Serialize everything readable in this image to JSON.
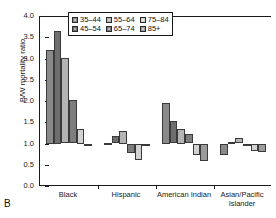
{
  "panel": {
    "letter": "B"
  },
  "chart_data": {
    "type": "bar",
    "title": "",
    "subtitle": "",
    "xlabel": "",
    "ylabel": "B/W mortality ratio",
    "ylim": [
      0.0,
      4.0
    ],
    "ytick_labels": [
      "0.0",
      "0.5",
      "1.0",
      "1.5",
      "2.0",
      "2.5",
      "3.0",
      "3.5",
      "4.0"
    ],
    "ytick_values": [
      0.0,
      0.5,
      1.0,
      1.5,
      2.0,
      2.5,
      3.0,
      3.5,
      4.0
    ],
    "grid": false,
    "reference_line": 1.0,
    "legend_position": "top-center",
    "categories": [
      "Black",
      "Hispanic",
      "American Indian",
      "Asian/Pacific Islander"
    ],
    "series": [
      {
        "name": "35–44",
        "color": "#8a8a8a",
        "values": [
          3.2,
          1.02,
          1.95,
          0.73
        ]
      },
      {
        "name": "45–54",
        "color": "#6e6e6e",
        "values": [
          3.65,
          1.18,
          1.52,
          1.04
        ]
      },
      {
        "name": "55–64",
        "color": "#b4b4b4",
        "values": [
          3.02,
          1.3,
          1.35,
          1.12
        ]
      },
      {
        "name": "65–74",
        "color": "#7d7d7d",
        "values": [
          2.02,
          0.78,
          1.22,
          0.97
        ]
      },
      {
        "name": "75–84",
        "color": "#d2d2d2",
        "values": [
          1.35,
          0.62,
          0.74,
          0.82
        ]
      },
      {
        "name": "85+",
        "color": "#9b9b9b",
        "values": [
          0.93,
          0.98,
          0.6,
          0.8
        ]
      }
    ]
  },
  "legend": {
    "rows": [
      [
        {
          "label": "35–44",
          "color": "#8a8a8a"
        },
        {
          "label": "55–64",
          "color": "#b4b4b4"
        },
        {
          "label": "75–84",
          "color": "#d2d2d2"
        }
      ],
      [
        {
          "label": "45–54",
          "color": "#6e6e6e"
        },
        {
          "label": "65–74",
          "color": "#7d7d7d"
        },
        {
          "label": "85+",
          "color": "#9b9b9b"
        }
      ]
    ]
  }
}
